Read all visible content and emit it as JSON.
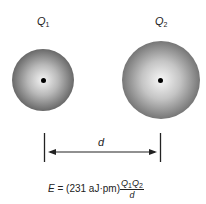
{
  "charges": [
    {
      "symbol": "Q",
      "subscript": "1"
    },
    {
      "symbol": "Q",
      "subscript": "2"
    }
  ],
  "distance_label": "d",
  "formula": {
    "lhs": "E",
    "equals": " = (231 aJ·pm)",
    "numerator": {
      "q1": "Q",
      "s1": "1",
      "q2": "Q",
      "s2": "2"
    },
    "denominator": "d"
  }
}
